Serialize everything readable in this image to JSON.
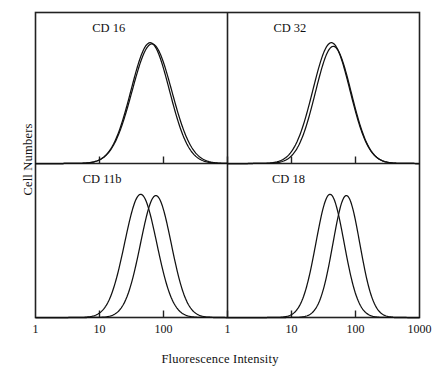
{
  "figure": {
    "xlabel": "Fluorescence Intensity",
    "ylabel": "Cell Numbers"
  },
  "chart_data": {
    "type": "line",
    "title": "",
    "xlabel": "Fluorescence Intensity",
    "ylabel": "Cell Numbers",
    "xscale": "log",
    "grid": false,
    "legend": "none",
    "panel_layout": "2x2",
    "series_styles": [
      {
        "name": "solid",
        "dash": "none",
        "color": "#111111"
      },
      {
        "name": "dashed",
        "dash": "4,3",
        "color": "#111111"
      }
    ],
    "panels": [
      {
        "label": "CD 16",
        "position": "top-left",
        "xlim": [
          1,
          1000
        ],
        "xticks": [
          1,
          10,
          100
        ],
        "xticklabels": [
          "1",
          "10",
          "100"
        ],
        "series": [
          {
            "name": "solid",
            "peak_x": 62,
            "peak_height": 1.0,
            "width_decades": 0.3
          },
          {
            "name": "dashed",
            "peak_x": 66,
            "peak_height": 0.99,
            "width_decades": 0.31
          }
        ]
      },
      {
        "label": "CD 32",
        "position": "top-right",
        "xlim": [
          1,
          1000
        ],
        "xticks": [
          1,
          10,
          100,
          1000
        ],
        "xticklabels": [
          "1",
          "10",
          "100",
          "1000"
        ],
        "series": [
          {
            "name": "solid",
            "peak_x": 42,
            "peak_height": 1.0,
            "width_decades": 0.29
          },
          {
            "name": "dashed",
            "peak_x": 45,
            "peak_height": 0.97,
            "width_decades": 0.28
          }
        ]
      },
      {
        "label": "CD 11b",
        "position": "bottom-left",
        "xlim": [
          1,
          1000
        ],
        "xticks": [
          1,
          10,
          100
        ],
        "xticklabels": [
          "1",
          "10",
          "100"
        ],
        "series": [
          {
            "name": "solid",
            "peak_x": 44,
            "peak_height": 1.0,
            "width_decades": 0.25
          },
          {
            "name": "dashed",
            "peak_x": 76,
            "peak_height": 0.99,
            "width_decades": 0.24
          }
        ]
      },
      {
        "label": "CD 18",
        "position": "bottom-right",
        "xlim": [
          1,
          1000
        ],
        "xticks": [
          1,
          10,
          100,
          1000
        ],
        "xticklabels": [
          "1",
          "10",
          "100",
          "1000"
        ],
        "series": [
          {
            "name": "solid",
            "peak_x": 40,
            "peak_height": 1.0,
            "width_decades": 0.22
          },
          {
            "name": "dashed",
            "peak_x": 72,
            "peak_height": 0.99,
            "width_decades": 0.21
          }
        ]
      }
    ]
  }
}
